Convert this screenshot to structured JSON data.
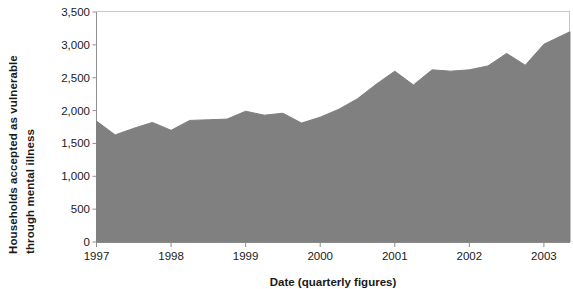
{
  "chart_data": {
    "type": "area",
    "title": "",
    "xlabel": "Date (quarterly figures)",
    "ylabel": "Households accepted as vulnerable through mental illness",
    "ylabel_lines": [
      "Households accepted as vulnerable",
      "through mental illness"
    ],
    "ylim": [
      0,
      3500
    ],
    "ytick_labels": [
      "3,500",
      "3,000",
      "2,500",
      "2,000",
      "1,500",
      "1,000",
      "500",
      "0"
    ],
    "ytick_values": [
      3500,
      3000,
      2500,
      2000,
      1500,
      1000,
      500,
      0
    ],
    "xtick_labels": [
      "1997",
      "1998",
      "1999",
      "2000",
      "2001",
      "2002",
      "2003"
    ],
    "xtick_values": [
      1997,
      1998,
      1999,
      2000,
      2001,
      2002,
      2003
    ],
    "xlim": [
      1997,
      2003.35
    ],
    "grid": false,
    "legend": "none",
    "fill_color": "#808080",
    "line_color": "#808080",
    "background_color": "#ffffff",
    "axis_color": "#808080",
    "series": [
      {
        "name": "Households accepted as vulnerable through mental illness",
        "x": [
          1997.0,
          1997.25,
          1997.5,
          1997.75,
          1998.0,
          1998.25,
          1998.5,
          1998.75,
          1999.0,
          1999.25,
          1999.5,
          1999.75,
          2000.0,
          2000.25,
          2000.5,
          2000.75,
          2001.0,
          2001.25,
          2001.5,
          2001.75,
          2002.0,
          2002.25,
          2002.5,
          2002.75,
          2003.0,
          2003.35
        ],
        "values": [
          1840,
          1630,
          1730,
          1820,
          1700,
          1850,
          1860,
          1870,
          1990,
          1930,
          1960,
          1810,
          1900,
          2020,
          2180,
          2400,
          2600,
          2390,
          2620,
          2600,
          2620,
          2680,
          2870,
          2690,
          3010,
          3200
        ]
      }
    ]
  }
}
